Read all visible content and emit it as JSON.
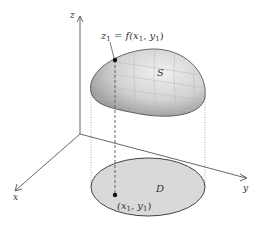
{
  "figure": {
    "axes": {
      "x_label": "x",
      "y_label": "y",
      "z_label": "z"
    },
    "surface": {
      "label": "S",
      "fill_color": "#b5b5b5",
      "highlight_color": "#e6e6e6"
    },
    "region": {
      "label": "D",
      "fill_color": "#d9d9d9"
    },
    "surface_point": {
      "label_lhs": "z",
      "label_sub": "1",
      "label_rhs": " = f(x",
      "label_sub2": "1",
      "label_mid": ", y",
      "label_sub3": "1",
      "label_end": ")"
    },
    "region_point": {
      "label_open": "(x",
      "label_sub": "1",
      "label_mid": ", y",
      "label_sub2": "1",
      "label_end": ")"
    }
  }
}
